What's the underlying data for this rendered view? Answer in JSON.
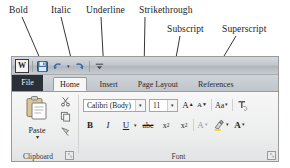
{
  "annotations": [
    {
      "id": "bold",
      "label": "Bold"
    },
    {
      "id": "italic",
      "label": "Italic"
    },
    {
      "id": "underline",
      "label": "Underline"
    },
    {
      "id": "strikethrough",
      "label": "Strikethrough"
    },
    {
      "id": "subscript",
      "label": "Subscript"
    },
    {
      "id": "superscript",
      "label": "Superscript"
    }
  ],
  "window": {
    "quick_access": {
      "logo": "W",
      "items": [
        {
          "name": "save-icon",
          "label": "Save"
        },
        {
          "name": "undo-icon",
          "label": "Undo"
        },
        {
          "name": "redo-icon",
          "label": "Redo"
        },
        {
          "name": "customize-quick-access-icon",
          "label": "Customize Quick Access Toolbar"
        }
      ]
    },
    "tabs": [
      {
        "id": "file",
        "label": "File",
        "active": false,
        "file": true
      },
      {
        "id": "home",
        "label": "Home",
        "active": true,
        "file": false
      },
      {
        "id": "insert",
        "label": "Insert",
        "active": false,
        "file": false
      },
      {
        "id": "pagelayout",
        "label": "Page Layout",
        "active": false,
        "file": false
      },
      {
        "id": "references",
        "label": "References",
        "active": false,
        "file": false
      }
    ],
    "groups": {
      "clipboard": {
        "label": "Clipboard",
        "paste_label": "Paste",
        "paste_arrow": "▾",
        "launcher_glyph": "⤡",
        "mini_buttons": [
          {
            "name": "cut-icon",
            "label": "Cut"
          },
          {
            "name": "copy-icon",
            "label": "Copy"
          },
          {
            "name": "format-painter-icon",
            "label": "Format Painter"
          }
        ]
      },
      "font": {
        "label": "Font",
        "launcher_glyph": "⤡",
        "font_name": "Calibri (Body)",
        "font_size": "11",
        "dropdown_glyph": "▾",
        "grow_font": "A",
        "shrink_font": "A",
        "change_case": "Aa",
        "clear_formatting_label": "Clear Formatting",
        "bold": "B",
        "italic": "I",
        "underline": "U",
        "strikethrough": "abc",
        "subscript_base": "x",
        "subscript_mark": "2",
        "superscript_base": "x",
        "superscript_mark": "2",
        "text_effects": "A",
        "highlight_label": "Text Highlight Color",
        "font_color": "A"
      }
    }
  },
  "colors": {
    "file_tab": "#2b3038",
    "window_border": "#9a9a9a",
    "ribbon_bg": "#eceded",
    "active_tab": "#f6f6f6",
    "leader_line": "#1f1f1f",
    "font_color_accent": "#c00000",
    "highlight_accent": "#ffd400"
  }
}
